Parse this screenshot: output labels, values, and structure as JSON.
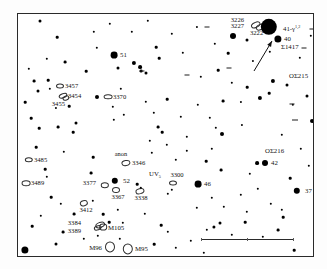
{
  "chart_title": "Leo star and galaxy finder chart",
  "frame": {
    "x": 17,
    "y": 13,
    "w": 297,
    "h": 244
  },
  "labels": [
    {
      "id": "ngc3226",
      "text": "3226",
      "x": 243,
      "y": 19,
      "size": 6.6,
      "align": "l"
    },
    {
      "id": "ngc3227",
      "text": "3227",
      "x": 243,
      "y": 25,
      "size": 6.6,
      "align": "l"
    },
    {
      "id": "ngc3222",
      "text": "3222",
      "x": 249,
      "y": 32,
      "size": 6.6,
      "align": "r"
    },
    {
      "id": "star41gamma",
      "text": "41-γ",
      "sup": "1,2",
      "x": 282,
      "y": 28,
      "size": 6.8,
      "align": "r"
    },
    {
      "id": "star40",
      "text": "40",
      "x": 283,
      "y": 38,
      "size": 6.8,
      "align": "r"
    },
    {
      "id": "sigma1417",
      "text": "Σ1417",
      "x": 280,
      "y": 46,
      "size": 6.8,
      "align": "r"
    },
    {
      "id": "osigma215",
      "text": "OΣ215",
      "x": 288,
      "y": 75,
      "size": 6.8,
      "align": "r"
    },
    {
      "id": "star51",
      "text": "51",
      "x": 119,
      "y": 54,
      "size": 6.8,
      "align": "r"
    },
    {
      "id": "ngc3457",
      "text": "3457",
      "x": 64,
      "y": 85,
      "size": 6.6,
      "align": "r"
    },
    {
      "id": "ngc3454",
      "text": "3454",
      "x": 67,
      "y": 95,
      "size": 6.6,
      "align": "r"
    },
    {
      "id": "ngc3455",
      "text": "3455",
      "x": 64,
      "y": 103,
      "size": 6.6,
      "align": "l"
    },
    {
      "id": "ngc3370",
      "text": "3370",
      "x": 112,
      "y": 96,
      "size": 6.6,
      "align": "r"
    },
    {
      "id": "ngc3485",
      "text": "3485",
      "x": 33,
      "y": 159,
      "size": 6.6,
      "align": "r"
    },
    {
      "id": "ngc3489",
      "text": "3489",
      "x": 30,
      "y": 182,
      "size": 6.6,
      "align": "r"
    },
    {
      "id": "anon",
      "text": "anon",
      "x": 120,
      "y": 153,
      "size": 6.4,
      "align": "c"
    },
    {
      "id": "ngc3346",
      "text": "3346",
      "x": 131,
      "y": 162,
      "size": 6.6,
      "align": "r"
    },
    {
      "id": "ngc3377",
      "text": "3377",
      "x": 95,
      "y": 182,
      "size": 6.6,
      "align": "l"
    },
    {
      "id": "star52",
      "text": "52",
      "x": 122,
      "y": 180,
      "size": 6.8,
      "align": "r"
    },
    {
      "id": "ngc3367",
      "text": "3367",
      "x": 117,
      "y": 196,
      "size": 6.6,
      "align": "c"
    },
    {
      "id": "ngc3338",
      "text": "3338",
      "x": 140,
      "y": 197,
      "size": 6.6,
      "align": "c"
    },
    {
      "id": "uvleo",
      "text": "UV",
      "sub": "5",
      "x": 154,
      "y": 174,
      "size": 6.8,
      "align": "c"
    },
    {
      "id": "ngc3300",
      "text": "3300",
      "x": 176,
      "y": 174,
      "size": 6.6,
      "align": "c"
    },
    {
      "id": "star46",
      "text": "46",
      "x": 203,
      "y": 183,
      "size": 6.8,
      "align": "r"
    },
    {
      "id": "osigma216",
      "text": "OΣ216",
      "x": 264,
      "y": 150,
      "size": 6.8,
      "align": "r"
    },
    {
      "id": "star42",
      "text": "42",
      "x": 270,
      "y": 162,
      "size": 6.8,
      "align": "r"
    },
    {
      "id": "star37",
      "text": "37",
      "x": 304,
      "y": 190,
      "size": 6.8,
      "align": "r"
    },
    {
      "id": "ngc3412",
      "text": "3412",
      "x": 85,
      "y": 209,
      "size": 6.6,
      "align": "c"
    },
    {
      "id": "ngc3384",
      "text": "3384",
      "x": 80,
      "y": 222,
      "size": 6.6,
      "align": "l"
    },
    {
      "id": "ngc3389",
      "text": "3389",
      "x": 80,
      "y": 230,
      "size": 6.6,
      "align": "l"
    },
    {
      "id": "m105",
      "text": "M105",
      "x": 107,
      "y": 227,
      "size": 6.8,
      "align": "r"
    },
    {
      "id": "m96",
      "text": "M96",
      "x": 101,
      "y": 247,
      "size": 6.8,
      "align": "l"
    },
    {
      "id": "m95",
      "text": "M95",
      "x": 134,
      "y": 248,
      "size": 6.8,
      "align": "r"
    }
  ],
  "galaxies": [
    {
      "id": "g3226",
      "x": 255,
      "y": 24,
      "rx": 4.2,
      "ry": 2.2,
      "rot": -25
    },
    {
      "id": "g3227",
      "x": 259,
      "y": 26,
      "rx": 3.4,
      "ry": 1.8,
      "rot": -25
    },
    {
      "id": "g3457",
      "x": 59,
      "y": 85,
      "rx": 3.0,
      "ry": 1.6,
      "rot": 0
    },
    {
      "id": "g3454",
      "x": 62,
      "y": 95,
      "rx": 3.4,
      "ry": 1.7,
      "rot": -20
    },
    {
      "id": "g3455",
      "x": 65,
      "y": 97,
      "rx": 2.6,
      "ry": 1.5,
      "rot": -20
    },
    {
      "id": "g3370",
      "x": 107,
      "y": 96,
      "rx": 3.4,
      "ry": 1.7,
      "rot": 0
    },
    {
      "id": "g3485",
      "x": 28,
      "y": 159,
      "rx": 3.2,
      "ry": 1.7,
      "rot": 0
    },
    {
      "id": "g3489",
      "x": 25,
      "y": 182,
      "rx": 3.4,
      "ry": 1.8,
      "rot": 0
    },
    {
      "id": "g3346",
      "x": 125,
      "y": 162,
      "rx": 3.6,
      "ry": 2.0,
      "rot": -10
    },
    {
      "id": "g3377",
      "x": 104,
      "y": 184,
      "rx": 3.2,
      "ry": 1.8,
      "rot": 0
    },
    {
      "id": "g3367",
      "x": 115,
      "y": 189,
      "rx": 3.0,
      "ry": 2.0,
      "rot": 0
    },
    {
      "id": "g3338",
      "x": 139,
      "y": 190,
      "rx": 3.6,
      "ry": 1.8,
      "rot": -15
    },
    {
      "id": "g3300",
      "x": 172,
      "y": 182,
      "rx": 3.0,
      "ry": 1.6,
      "rot": 0
    },
    {
      "id": "g3412",
      "x": 83,
      "y": 202,
      "rx": 3.2,
      "ry": 1.8,
      "rot": -15
    },
    {
      "id": "g3384",
      "x": 99,
      "y": 224,
      "rx": 3.8,
      "ry": 2.0,
      "rot": -20
    },
    {
      "id": "g3389",
      "x": 97,
      "y": 227,
      "rx": 3.2,
      "ry": 1.7,
      "rot": -20
    },
    {
      "id": "gM105",
      "x": 102,
      "y": 226,
      "rx": 2.8,
      "ry": 2.4,
      "rot": 0
    },
    {
      "id": "gM96",
      "x": 109,
      "y": 246,
      "rx": 4.0,
      "ry": 4.6,
      "rot": 0
    },
    {
      "id": "gM95",
      "x": 127,
      "y": 248,
      "rx": 4.2,
      "ry": 4.6,
      "rot": 0
    }
  ],
  "stars": [
    {
      "x": 268,
      "y": 26,
      "r": 8.2
    },
    {
      "x": 277,
      "y": 38,
      "r": 3.6
    },
    {
      "x": 232,
      "y": 35,
      "r": 3.0
    },
    {
      "x": 246,
      "y": 39,
      "r": 1.5
    },
    {
      "x": 113,
      "y": 54,
      "r": 3.4
    },
    {
      "x": 272,
      "y": 80,
      "r": 2.1
    },
    {
      "x": 286,
      "y": 84,
      "r": 1.5
    },
    {
      "x": 256,
      "y": 162,
      "r": 1.9
    },
    {
      "x": 264,
      "y": 162,
      "r": 3.0
    },
    {
      "x": 296,
      "y": 190,
      "r": 3.2
    },
    {
      "x": 197,
      "y": 183,
      "r": 3.4
    },
    {
      "x": 114,
      "y": 180,
      "r": 3.2
    },
    {
      "x": 24,
      "y": 249,
      "r": 3.6
    },
    {
      "x": 39,
      "y": 20,
      "r": 1.5
    },
    {
      "x": 56,
      "y": 36,
      "r": 1.3
    },
    {
      "x": 96,
      "y": 47,
      "r": 1.2
    },
    {
      "x": 131,
      "y": 31,
      "r": 1.2
    },
    {
      "x": 155,
      "y": 46,
      "r": 1.3
    },
    {
      "x": 117,
      "y": 67,
      "r": 1.5
    },
    {
      "x": 133,
      "y": 62,
      "r": 2.1
    },
    {
      "x": 139,
      "y": 66,
      "r": 1.9
    },
    {
      "x": 145,
      "y": 72,
      "r": 1.5
    },
    {
      "x": 140,
      "y": 70,
      "r": 1.4
    },
    {
      "x": 158,
      "y": 57,
      "r": 1.3
    },
    {
      "x": 171,
      "y": 33,
      "r": 1.2
    },
    {
      "x": 196,
      "y": 26,
      "r": 1.1
    },
    {
      "x": 214,
      "y": 43,
      "r": 1.2
    },
    {
      "x": 227,
      "y": 52,
      "r": 1.3
    },
    {
      "x": 252,
      "y": 60,
      "r": 1.1
    },
    {
      "x": 269,
      "y": 51,
      "r": 1.2
    },
    {
      "x": 299,
      "y": 57,
      "r": 1.2
    },
    {
      "x": 310,
      "y": 35,
      "r": 1.2
    },
    {
      "x": 33,
      "y": 80,
      "r": 1.4
    },
    {
      "x": 47,
      "y": 79,
      "r": 1.3
    },
    {
      "x": 37,
      "y": 90,
      "r": 1.5
    },
    {
      "x": 24,
      "y": 101,
      "r": 1.3
    },
    {
      "x": 49,
      "y": 88,
      "r": 1.2
    },
    {
      "x": 55,
      "y": 107,
      "r": 1.1
    },
    {
      "x": 68,
      "y": 105,
      "r": 1.3
    },
    {
      "x": 96,
      "y": 96,
      "r": 2.0
    },
    {
      "x": 112,
      "y": 106,
      "r": 1.2
    },
    {
      "x": 123,
      "y": 114,
      "r": 1.2
    },
    {
      "x": 166,
      "y": 98,
      "r": 1.3
    },
    {
      "x": 200,
      "y": 76,
      "r": 1.2
    },
    {
      "x": 217,
      "y": 69,
      "r": 1.3
    },
    {
      "x": 231,
      "y": 82,
      "r": 1.2
    },
    {
      "x": 246,
      "y": 86,
      "r": 1.3
    },
    {
      "x": 259,
      "y": 97,
      "r": 2.1
    },
    {
      "x": 268,
      "y": 92,
      "r": 1.3
    },
    {
      "x": 240,
      "y": 101,
      "r": 1.1
    },
    {
      "x": 222,
      "y": 100,
      "r": 1.4
    },
    {
      "x": 197,
      "y": 104,
      "r": 1.2
    },
    {
      "x": 292,
      "y": 104,
      "r": 1.2
    },
    {
      "x": 306,
      "y": 95,
      "r": 1.5
    },
    {
      "x": 311,
      "y": 120,
      "r": 2.0
    },
    {
      "x": 30,
      "y": 117,
      "r": 1.3
    },
    {
      "x": 38,
      "y": 127,
      "r": 1.3
    },
    {
      "x": 57,
      "y": 126,
      "r": 1.4
    },
    {
      "x": 75,
      "y": 122,
      "r": 1.5
    },
    {
      "x": 72,
      "y": 131,
      "r": 1.3
    },
    {
      "x": 113,
      "y": 119,
      "r": 1.2
    },
    {
      "x": 157,
      "y": 126,
      "r": 1.4
    },
    {
      "x": 161,
      "y": 131,
      "r": 1.3
    },
    {
      "x": 149,
      "y": 140,
      "r": 1.2
    },
    {
      "x": 186,
      "y": 136,
      "r": 1.2
    },
    {
      "x": 215,
      "y": 127,
      "r": 1.2
    },
    {
      "x": 221,
      "y": 133,
      "r": 2.0
    },
    {
      "x": 241,
      "y": 124,
      "r": 1.1
    },
    {
      "x": 281,
      "y": 134,
      "r": 1.2
    },
    {
      "x": 35,
      "y": 146,
      "r": 1.3
    },
    {
      "x": 63,
      "y": 151,
      "r": 1.2
    },
    {
      "x": 44,
      "y": 168,
      "r": 1.3
    },
    {
      "x": 46,
      "y": 176,
      "r": 1.2
    },
    {
      "x": 92,
      "y": 156,
      "r": 1.3
    },
    {
      "x": 151,
      "y": 152,
      "r": 1.2
    },
    {
      "x": 175,
      "y": 159,
      "r": 1.2
    },
    {
      "x": 220,
      "y": 169,
      "r": 1.4
    },
    {
      "x": 249,
      "y": 173,
      "r": 1.2
    },
    {
      "x": 289,
      "y": 177,
      "r": 1.3
    },
    {
      "x": 90,
      "y": 172,
      "r": 1.4
    },
    {
      "x": 136,
      "y": 183,
      "r": 1.3
    },
    {
      "x": 140,
      "y": 187,
      "r": 1.2
    },
    {
      "x": 171,
      "y": 189,
      "r": 1.2
    },
    {
      "x": 167,
      "y": 193,
      "r": 1.2
    },
    {
      "x": 50,
      "y": 196,
      "r": 1.3
    },
    {
      "x": 60,
      "y": 203,
      "r": 1.2
    },
    {
      "x": 73,
      "y": 213,
      "r": 1.4
    },
    {
      "x": 92,
      "y": 200,
      "r": 1.2
    },
    {
      "x": 102,
      "y": 213,
      "r": 1.3
    },
    {
      "x": 117,
      "y": 209,
      "r": 1.2
    },
    {
      "x": 108,
      "y": 221,
      "r": 1.3
    },
    {
      "x": 122,
      "y": 222,
      "r": 1.2
    },
    {
      "x": 40,
      "y": 215,
      "r": 1.2
    },
    {
      "x": 31,
      "y": 225,
      "r": 1.3
    },
    {
      "x": 62,
      "y": 231,
      "r": 1.4
    },
    {
      "x": 83,
      "y": 238,
      "r": 1.2
    },
    {
      "x": 97,
      "y": 235,
      "r": 1.2
    },
    {
      "x": 119,
      "y": 238,
      "r": 1.2
    },
    {
      "x": 144,
      "y": 213,
      "r": 1.2
    },
    {
      "x": 160,
      "y": 224,
      "r": 1.3
    },
    {
      "x": 167,
      "y": 231,
      "r": 1.2
    },
    {
      "x": 153,
      "y": 243,
      "r": 1.3
    },
    {
      "x": 175,
      "y": 247,
      "r": 1.2
    },
    {
      "x": 190,
      "y": 240,
      "r": 1.2
    },
    {
      "x": 206,
      "y": 229,
      "r": 1.2
    },
    {
      "x": 213,
      "y": 226,
      "r": 1.6
    },
    {
      "x": 219,
      "y": 222,
      "r": 1.5
    },
    {
      "x": 231,
      "y": 234,
      "r": 1.2
    },
    {
      "x": 244,
      "y": 221,
      "r": 1.3
    },
    {
      "x": 246,
      "y": 211,
      "r": 1.2
    },
    {
      "x": 262,
      "y": 236,
      "r": 1.2
    },
    {
      "x": 277,
      "y": 229,
      "r": 1.4
    },
    {
      "x": 282,
      "y": 216,
      "r": 1.3
    },
    {
      "x": 281,
      "y": 209,
      "r": 1.2
    },
    {
      "x": 270,
      "y": 203,
      "r": 1.2
    },
    {
      "x": 240,
      "y": 194,
      "r": 1.2
    },
    {
      "x": 211,
      "y": 197,
      "r": 1.2
    },
    {
      "x": 196,
      "y": 207,
      "r": 1.2
    },
    {
      "x": 223,
      "y": 206,
      "r": 1.2
    },
    {
      "x": 293,
      "y": 249,
      "r": 1.3
    },
    {
      "x": 203,
      "y": 252,
      "r": 1.2
    },
    {
      "x": 257,
      "y": 188,
      "r": 1.2
    },
    {
      "x": 205,
      "y": 160,
      "r": 1.3
    },
    {
      "x": 211,
      "y": 148,
      "r": 1.2
    },
    {
      "x": 186,
      "y": 150,
      "r": 1.2
    },
    {
      "x": 166,
      "y": 144,
      "r": 1.2
    },
    {
      "x": 209,
      "y": 117,
      "r": 1.2
    },
    {
      "x": 180,
      "y": 116,
      "r": 1.2
    },
    {
      "x": 153,
      "y": 112,
      "r": 1.2
    },
    {
      "x": 145,
      "y": 101,
      "r": 1.2
    },
    {
      "x": 120,
      "y": 88,
      "r": 1.2
    },
    {
      "x": 85,
      "y": 70,
      "r": 1.3
    },
    {
      "x": 64,
      "y": 61,
      "r": 1.4
    },
    {
      "x": 46,
      "y": 58,
      "r": 1.2
    },
    {
      "x": 28,
      "y": 68,
      "r": 1.2
    },
    {
      "x": 93,
      "y": 31,
      "r": 1.2
    },
    {
      "x": 109,
      "y": 23,
      "r": 1.2
    },
    {
      "x": 147,
      "y": 20,
      "r": 1.2
    },
    {
      "x": 182,
      "y": 52,
      "r": 1.2
    },
    {
      "x": 300,
      "y": 148,
      "r": 1.2
    },
    {
      "x": 308,
      "y": 165,
      "r": 1.2
    },
    {
      "x": 55,
      "y": 243,
      "r": 1.5
    }
  ],
  "double_bars": [
    {
      "x": 206,
      "y": 26,
      "w": 5,
      "rot": 0
    },
    {
      "x": 311,
      "y": 28,
      "w": 5,
      "rot": 0
    },
    {
      "x": 303,
      "y": 47,
      "w": 5,
      "rot": 0
    },
    {
      "x": 291,
      "y": 103,
      "w": 5,
      "rot": 0
    },
    {
      "x": 294,
      "y": 119,
      "w": 6,
      "rot": 0
    },
    {
      "x": 186,
      "y": 74,
      "w": 5,
      "rot": 0
    },
    {
      "x": 228,
      "y": 67,
      "w": 5,
      "rot": 0
    },
    {
      "x": 141,
      "y": 70,
      "w": 5,
      "rot": 0
    }
  ],
  "arrow": {
    "x1": 253,
    "y1": 70,
    "x2": 271,
    "y2": 40
  },
  "scalebar": {
    "x": 200,
    "y": 238,
    "w": 92,
    "ticks": [
      0,
      0.5,
      1.0
    ]
  }
}
